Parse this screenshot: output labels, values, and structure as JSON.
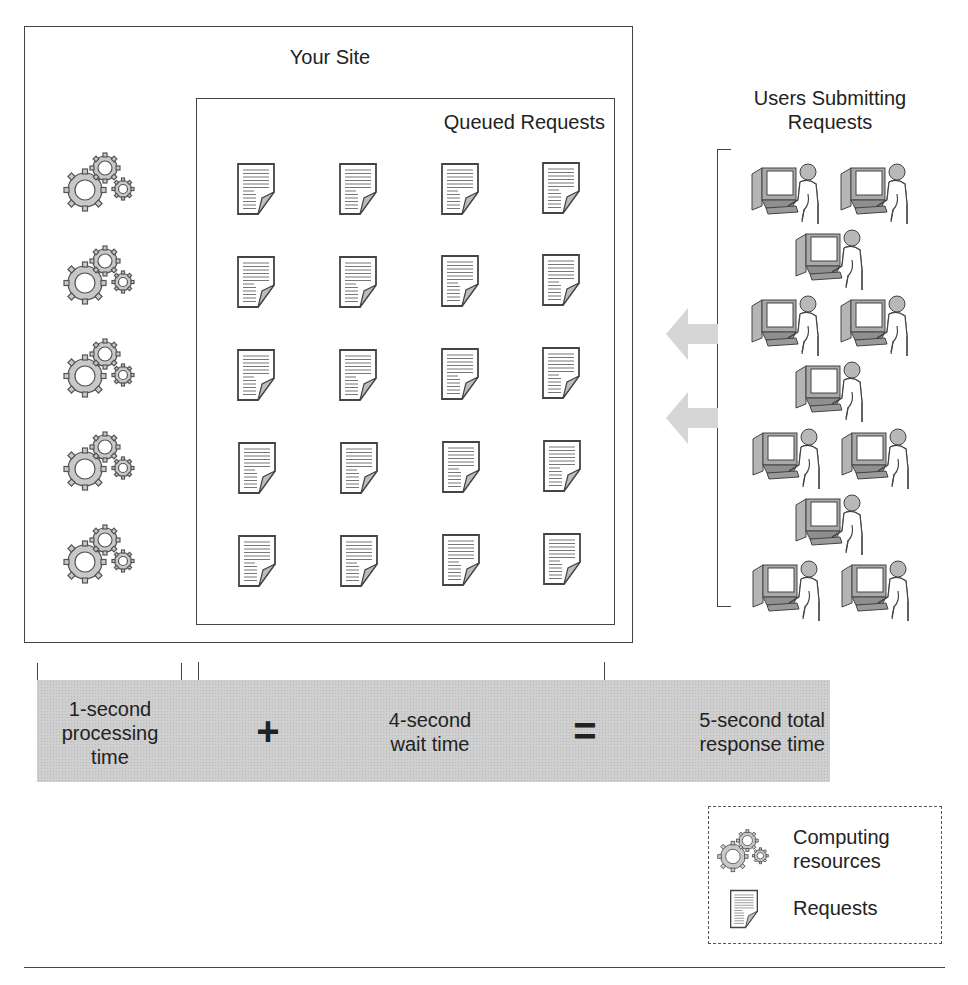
{
  "diagram": {
    "site_title": "Your Site",
    "queue_title": "Queued Requests",
    "users_title_line1": "Users Submitting",
    "users_title_line2": "Requests",
    "computing_resource_count": 5,
    "queued_request_grid": {
      "rows": 5,
      "cols": 4,
      "count": 20
    },
    "user_count": 12,
    "incoming_arrow_count": 2
  },
  "equation": {
    "term1": {
      "line1": "1-second",
      "line2": "processing",
      "line3": "time"
    },
    "plus": "+",
    "term2": {
      "line1": "4-second",
      "line2": "wait time"
    },
    "equals": "=",
    "result": {
      "line1": "5-second total",
      "line2": "response time"
    }
  },
  "legend": {
    "items": [
      {
        "icon": "gears-icon",
        "line1": "Computing",
        "line2": "resources"
      },
      {
        "icon": "document-icon",
        "line1": "Requests"
      }
    ]
  },
  "colors": {
    "stroke": "#444444",
    "band_fill": "#cfcfcf",
    "gear_fill": "#c8c8c8",
    "arrow_fill": "#d6d6d6"
  }
}
